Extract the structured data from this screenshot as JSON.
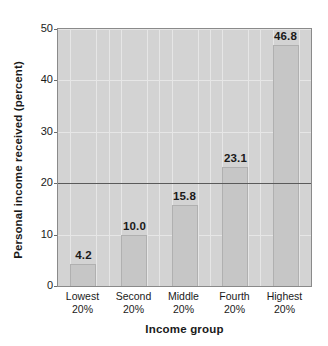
{
  "chart_data": {
    "type": "bar",
    "title": "",
    "subtitle": "",
    "xlabel": "Income group",
    "ylabel": "Personal income received (percent)",
    "categories": [
      "Lowest\n20%",
      "Second\n20%",
      "Middle\n20%",
      "Fourth\n20%",
      "Highest\n20%"
    ],
    "category_lines": [
      [
        "Lowest",
        "20%"
      ],
      [
        "Second",
        "20%"
      ],
      [
        "Middle",
        "20%"
      ],
      [
        "Fourth",
        "20%"
      ],
      [
        "Highest",
        "20%"
      ]
    ],
    "values": [
      4.2,
      10.0,
      15.8,
      23.1,
      46.8
    ],
    "value_labels": [
      "4.2",
      "10.0",
      "15.8",
      "23.1",
      "46.8"
    ],
    "ylim": [
      0,
      50
    ],
    "yticks": [
      0,
      10,
      20,
      30,
      40,
      50
    ],
    "ytick_labels": [
      "0",
      "10",
      "20",
      "30",
      "40",
      "50"
    ],
    "grid": true,
    "legend": "none",
    "reference_line": {
      "value": 20,
      "label": ""
    },
    "colors": {
      "plot_background": "#d3d3d3",
      "bar_fill": "#c6c6c6",
      "bar_border": "#b0b0b0",
      "gridline": "#e6e6e6",
      "axis": "#8a8a8a",
      "reference_line": "#5a5a5a",
      "text": "#1a1a1a",
      "page_background": "#ffffff"
    }
  }
}
